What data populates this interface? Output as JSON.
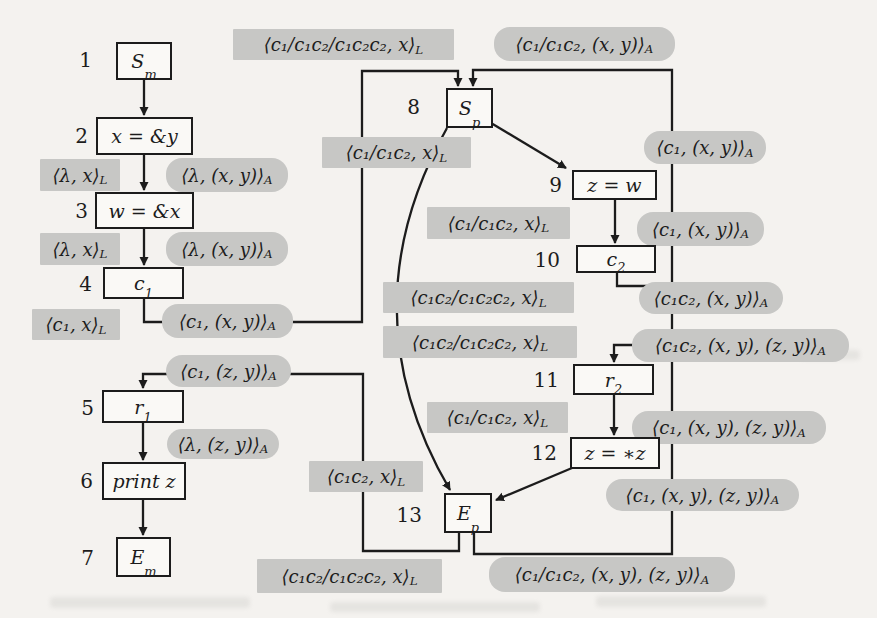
{
  "figure": {
    "type": "interprocedural control-flow graph with call-strings data-flow facts",
    "colors": {
      "page_bg": "#f4f2ef",
      "fact_label_bg": "#c7c7c5",
      "ink": "#1c1c1c"
    }
  },
  "nodes": [
    {
      "num": "1",
      "base": "S",
      "sub": "m"
    },
    {
      "num": "2",
      "base": "x = &y",
      "sub": ""
    },
    {
      "num": "3",
      "base": "w = &x",
      "sub": ""
    },
    {
      "num": "4",
      "base": "c",
      "sub": "1"
    },
    {
      "num": "5",
      "base": "r",
      "sub": "1"
    },
    {
      "num": "6",
      "base": "print z",
      "sub": ""
    },
    {
      "num": "7",
      "base": "E",
      "sub": "m"
    },
    {
      "num": "8",
      "base": "S",
      "sub": "p"
    },
    {
      "num": "9",
      "base": "z = w",
      "sub": ""
    },
    {
      "num": "10",
      "base": "c",
      "sub": "2"
    },
    {
      "num": "11",
      "base": "r",
      "sub": "2"
    },
    {
      "num": "12",
      "base": "z = ∗z",
      "sub": ""
    },
    {
      "num": "13",
      "base": "E",
      "sub": "p"
    }
  ],
  "labels": [
    {
      "body": "⟨λ, x⟩",
      "sub": "L"
    },
    {
      "body": "⟨λ, (x, y)⟩",
      "sub": "A"
    },
    {
      "body": "⟨λ, x⟩",
      "sub": "L"
    },
    {
      "body": "⟨λ, (x, y)⟩",
      "sub": "A"
    },
    {
      "body": "⟨c₁, x⟩",
      "sub": "L"
    },
    {
      "body": "⟨c₁, (x, y)⟩",
      "sub": "A"
    },
    {
      "body": "⟨c₁, (z, y)⟩",
      "sub": "A"
    },
    {
      "body": "⟨λ, (z, y)⟩",
      "sub": "A"
    },
    {
      "body": "⟨c₁/c₁c₂/c₁c₂c₂, x⟩",
      "sub": "L"
    },
    {
      "body": "⟨c₁/c₁c₂, (x, y)⟩",
      "sub": "A"
    },
    {
      "body": "⟨c₁/c₁c₂, x⟩",
      "sub": "L"
    },
    {
      "body": "⟨c₁/c₁c₂, x⟩",
      "sub": "L"
    },
    {
      "body": "⟨c₁c₂/c₁c₂c₂, x⟩",
      "sub": "L"
    },
    {
      "body": "⟨c₁c₂/c₁c₂c₂, x⟩",
      "sub": "L"
    },
    {
      "body": "⟨c₁/c₁c₂, x⟩",
      "sub": "L"
    },
    {
      "body": "⟨c₁c₂, x⟩",
      "sub": "L"
    },
    {
      "body": "⟨c₁c₂/c₁c₂c₂, x⟩",
      "sub": "L"
    },
    {
      "body": "⟨c₁, (x, y)⟩",
      "sub": "A"
    },
    {
      "body": "⟨c₁, (x, y)⟩",
      "sub": "A"
    },
    {
      "body": "⟨c₁c₂, (x, y)⟩",
      "sub": "A"
    },
    {
      "body": "⟨c₁c₂, (x, y), (z, y)⟩",
      "sub": "A"
    },
    {
      "body": "⟨c₁, (x, y), (z, y)⟩",
      "sub": "A"
    },
    {
      "body": "⟨c₁, (x, y), (z, y)⟩",
      "sub": "A"
    },
    {
      "body": "⟨c₁/c₁c₂, (x, y), (z, y)⟩",
      "sub": "A"
    }
  ]
}
